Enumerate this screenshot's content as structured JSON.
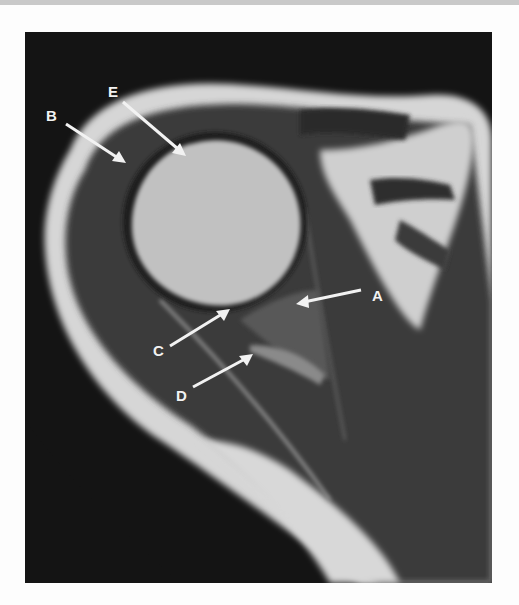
{
  "figure": {
    "colors": {
      "background": "#141414",
      "fat": "#dcdcdc",
      "muscle": "#3a3a3a",
      "bone": "#bdbdbd",
      "arrow": "#f2f2f2"
    },
    "labels": [
      {
        "id": "A",
        "text": "A",
        "x": 372,
        "y": 288
      },
      {
        "id": "B",
        "text": "B",
        "x": 46,
        "y": 108
      },
      {
        "id": "C",
        "text": "C",
        "x": 153,
        "y": 343
      },
      {
        "id": "D",
        "text": "D",
        "x": 176,
        "y": 388
      },
      {
        "id": "E",
        "text": "E",
        "x": 108,
        "y": 84
      }
    ]
  }
}
